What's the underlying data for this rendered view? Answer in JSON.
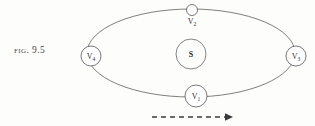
{
  "figure": {
    "caption_lead": "Fig.",
    "caption_number": "9.5",
    "caption_full": "Fig. 9.5"
  },
  "diagram": {
    "type": "orbit-diagram",
    "central_body": {
      "label": "S",
      "name": "sun",
      "cx": 191,
      "cy": 54,
      "r": 15
    },
    "orbit": {
      "cx": 191,
      "cy": 53,
      "rx": 104,
      "ry": 44,
      "stroke": "#5e5e5c"
    },
    "nodes": [
      {
        "id": "v1",
        "label": "V",
        "subscript": "1",
        "label_full": "V1",
        "position": "bottom",
        "cx": 196,
        "cy": 96,
        "r": 11,
        "label_inside": true
      },
      {
        "id": "v2",
        "label": "V",
        "subscript": "2",
        "label_full": "V2",
        "position": "top",
        "cx": 192,
        "cy": 10,
        "r": 5.5,
        "label_inside": false
      },
      {
        "id": "v3",
        "label": "V",
        "subscript": "3",
        "label_full": "V3",
        "position": "right",
        "cx": 296,
        "cy": 56,
        "r": 10,
        "label_inside": true
      },
      {
        "id": "v4",
        "label": "V",
        "subscript": "4",
        "label_full": "V4",
        "position": "left",
        "cx": 91,
        "cy": 56,
        "r": 10,
        "label_inside": true
      }
    ],
    "direction_arrow": {
      "name": "direction-of-motion",
      "x_start": 152,
      "x_end": 233,
      "y": 117,
      "points": "right",
      "style": "dashed",
      "color": "#3a3a3c"
    }
  }
}
